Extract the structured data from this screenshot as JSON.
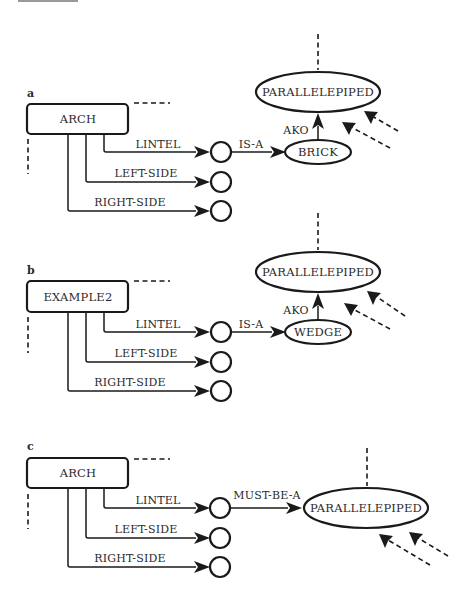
{
  "panels": [
    {
      "label": "a",
      "frame": "ARCH",
      "slots": [
        "LINTEL",
        "LEFT-SIDE",
        "RIGHT-SIDE"
      ],
      "link": "IS-A",
      "target": "BRICK",
      "parent_link": "AKO",
      "parent": "PARALLELEPIPED"
    },
    {
      "label": "b",
      "frame": "EXAMPLE2",
      "slots": [
        "LINTEL",
        "LEFT-SIDE",
        "RIGHT-SIDE"
      ],
      "link": "IS-A",
      "target": "WEDGE",
      "parent_link": "AKO",
      "parent": "PARALLELEPIPED"
    },
    {
      "label": "c",
      "frame": "ARCH",
      "slots": [
        "LINTEL",
        "LEFT-SIDE",
        "RIGHT-SIDE"
      ],
      "link": "MUST-BE-A",
      "target": "PARALLELEPIPED"
    }
  ],
  "colors": {
    "ink": "#1a1a1a",
    "background": "#ffffff"
  }
}
